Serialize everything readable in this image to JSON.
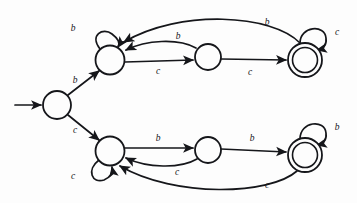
{
  "figure": {
    "alphabet": [
      "b",
      "c"
    ],
    "background_color": "#fdfdfd",
    "ink_color": "#15161a"
  },
  "states": [
    {
      "id": "q0",
      "name": "start-state",
      "cx": 57,
      "cy": 105,
      "r": 14,
      "accepting": false,
      "initial": true,
      "label": ""
    },
    {
      "id": "q1",
      "name": "upper-left-state",
      "cx": 110,
      "cy": 60,
      "r": 14.5,
      "accepting": false,
      "initial": false,
      "label": ""
    },
    {
      "id": "q2",
      "name": "upper-middle-state",
      "cx": 208,
      "cy": 57,
      "r": 13,
      "accepting": false,
      "initial": false,
      "label": ""
    },
    {
      "id": "q3",
      "name": "upper-accept-state",
      "cx": 305,
      "cy": 60,
      "r": 17,
      "accepting": true,
      "initial": false,
      "label": ""
    },
    {
      "id": "q4",
      "name": "lower-left-state",
      "cx": 110,
      "cy": 151,
      "r": 14.5,
      "accepting": false,
      "initial": false,
      "label": ""
    },
    {
      "id": "q5",
      "name": "lower-middle-state",
      "cx": 208,
      "cy": 150,
      "r": 13,
      "accepting": false,
      "initial": false,
      "label": ""
    },
    {
      "id": "q6",
      "name": "lower-accept-state",
      "cx": 305,
      "cy": 155,
      "r": 17,
      "accepting": true,
      "initial": false,
      "label": ""
    }
  ],
  "start_arrow": {
    "name": "start-arrow",
    "x1": 15,
    "y1": 105,
    "x2": 41,
    "y2": 105
  },
  "transitions": [
    {
      "id": "t1",
      "name": "edge-q1-self-b",
      "from": "q1",
      "to": "q1",
      "symbol": "b",
      "label_x": 73,
      "label_y": 29,
      "path": "M 100 49 C 89 35, 103 27, 112 34 C 120 40, 120 44, 118 47"
    },
    {
      "id": "t2",
      "name": "edge-q1-q2-c",
      "from": "q1",
      "to": "q2",
      "symbol": "c",
      "label_x": 158,
      "label_y": 72,
      "path": "M 125 62 L 193 60"
    },
    {
      "id": "t3",
      "name": "edge-q2-q1-b",
      "from": "q2",
      "to": "q1",
      "symbol": "b",
      "label_x": 178,
      "label_y": 37,
      "path": "M 196 48 C 178 38, 146 40, 126 50"
    },
    {
      "id": "t4",
      "name": "edge-q2-q3-c",
      "from": "q2",
      "to": "q3",
      "symbol": "c",
      "label_x": 250,
      "label_y": 73,
      "path": "M 221 59 L 286 60"
    },
    {
      "id": "t5",
      "name": "edge-q3-self-c",
      "from": "q3",
      "to": "q3",
      "symbol": "c",
      "label_x": 337,
      "label_y": 33,
      "path": "M 300 43 C 300 26, 325 24, 326 38 C 327 46, 322 49, 317 50"
    },
    {
      "id": "t6",
      "name": "edge-q3-q1-b",
      "from": "q3",
      "to": "q1",
      "symbol": "b",
      "label_x": 267,
      "label_y": 23,
      "path": "M 300 43 C 272 14, 180 9, 124 42"
    },
    {
      "id": "t7",
      "name": "edge-q0-q1-b",
      "from": "q0",
      "to": "q1",
      "symbol": "b",
      "label_x": 75,
      "label_y": 81,
      "path": "M 68 95 L 99 71"
    },
    {
      "id": "t8",
      "name": "edge-q0-q4-c",
      "from": "q0",
      "to": "q4",
      "symbol": "c",
      "label_x": 75,
      "label_y": 131,
      "path": "M 68 115 L 99 140"
    },
    {
      "id": "t9",
      "name": "edge-q4-self-c",
      "from": "q4",
      "to": "q4",
      "symbol": "c",
      "label_x": 73,
      "label_y": 177,
      "path": "M 99 160 C 86 170, 92 184, 104 180 C 111 177, 113 172, 112 167"
    },
    {
      "id": "t10",
      "name": "edge-q4-q5-b",
      "from": "q4",
      "to": "q5",
      "symbol": "b",
      "label_x": 158,
      "label_y": 139,
      "path": "M 125 148 L 193 148"
    },
    {
      "id": "t11",
      "name": "edge-q5-q4-c",
      "from": "q5",
      "to": "q4",
      "symbol": "c",
      "label_x": 177,
      "label_y": 173,
      "path": "M 197 159 C 180 169, 147 168, 126 158"
    },
    {
      "id": "t12",
      "name": "edge-q5-q6-b",
      "from": "q5",
      "to": "q6",
      "symbol": "b",
      "label_x": 252,
      "label_y": 139,
      "path": "M 221 149 L 286 152"
    },
    {
      "id": "t13",
      "name": "edge-q6-self-b",
      "from": "q6",
      "to": "q6",
      "symbol": "b",
      "label_x": 337,
      "label_y": 128,
      "path": "M 300 139 C 300 121, 325 119, 326 133 C 327 141, 322 144, 317 145"
    },
    {
      "id": "t14",
      "name": "edge-q6-q4-c",
      "from": "q6",
      "to": "q4",
      "symbol": "c",
      "label_x": 267,
      "label_y": 186,
      "path": "M 297 171 C 270 195, 175 198, 120 166"
    }
  ]
}
